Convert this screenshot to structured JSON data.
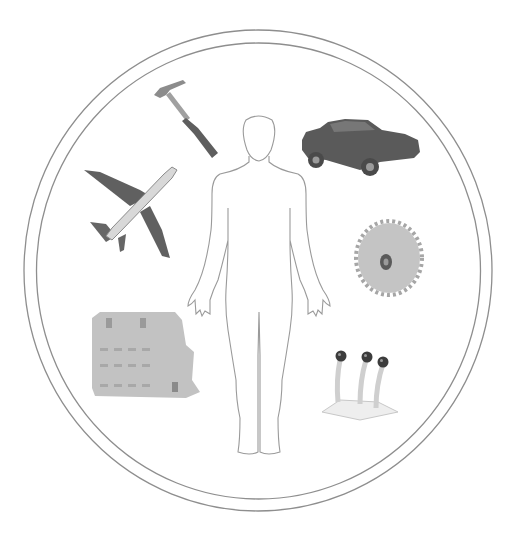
{
  "diagram": {
    "title": "",
    "frame": {
      "shape": "double-circle",
      "stroke_color": "#8a8a8a"
    },
    "center": {
      "label": "human-body-outline"
    },
    "items": [
      {
        "id": "hammer",
        "label": "Hammer",
        "position": "top-left"
      },
      {
        "id": "car",
        "label": "Car",
        "position": "top-right"
      },
      {
        "id": "airplane",
        "label": "Airplane",
        "position": "left"
      },
      {
        "id": "gear",
        "label": "Gear",
        "position": "right"
      },
      {
        "id": "building",
        "label": "Building / machine block",
        "position": "bottom-left"
      },
      {
        "id": "control-levers",
        "label": "Control levers",
        "position": "bottom-right"
      }
    ],
    "colors": {
      "outline": "#8a8a8a",
      "dark_object": "#5a5a5a",
      "mid_object": "#9a9a9a",
      "light_object": "#c8c8c8"
    }
  }
}
